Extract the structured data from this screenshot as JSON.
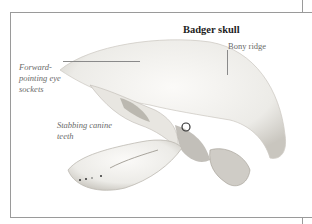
{
  "figure": {
    "title": "Badger skull",
    "labels": {
      "bony_ridge": "Bony ridge",
      "eye_sockets": "Forward-pointing eye sockets",
      "canine_teeth": "Stabbing canine teeth"
    },
    "colors": {
      "frame": "#9a9a9a",
      "title_text": "#1e1e1e",
      "label_text": "#6a6a6a",
      "bone": "#f4f2ee",
      "shadow": "#a8a49c"
    }
  }
}
